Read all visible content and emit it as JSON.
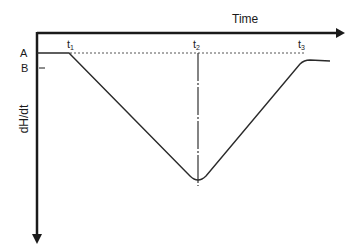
{
  "diagram": {
    "x_axis_label": "Time",
    "y_axis_label": "dH/dt",
    "levels": [
      {
        "label": "A"
      },
      {
        "label": "B"
      }
    ],
    "time_markers": [
      {
        "base": "t",
        "sub": "1"
      },
      {
        "base": "t",
        "sub": "2"
      },
      {
        "base": "t",
        "sub": "3"
      }
    ]
  },
  "colors": {
    "axis": "#1a1a1a",
    "curve": "#2a2a2a",
    "dashed": "#555555"
  }
}
